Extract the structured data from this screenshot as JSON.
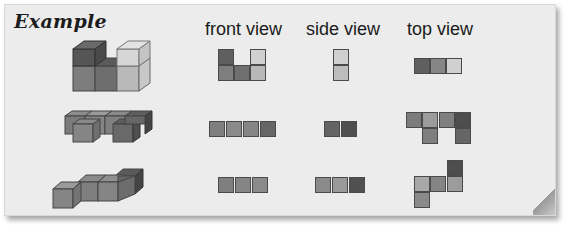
{
  "title": "Example",
  "columns": [
    {
      "label": "front view"
    },
    {
      "label": "side view"
    },
    {
      "label": "top view"
    }
  ],
  "colors": {
    "dark": "#5f5f5f",
    "darker": "#4e4e4e",
    "medium": "#8a8a8a",
    "medium_light": "#9c9c9c",
    "light": "#c4c4c4",
    "lighter": "#d4d4d4",
    "background": "#ececec"
  },
  "rows": [
    {
      "name": "example-1",
      "description": "U-shaped cube arrangement, 5 cubes",
      "front_view": [
        [
          1,
          0,
          1
        ],
        [
          1,
          1,
          1
        ]
      ],
      "side_view": [
        [
          1
        ],
        [
          1
        ]
      ],
      "top_view": [
        [
          1,
          1,
          1
        ]
      ]
    },
    {
      "name": "example-2",
      "description": "Flat arrangement of 6 cubes in two rows",
      "front_view": [
        [
          1,
          1,
          1,
          1
        ]
      ],
      "side_view": [
        [
          1,
          1
        ]
      ],
      "top_view": [
        [
          1,
          1,
          1,
          1
        ],
        [
          0,
          1,
          0,
          1
        ]
      ]
    },
    {
      "name": "example-3",
      "description": "Flat L/Z-shaped arrangement of 5 cubes",
      "front_view": [
        [
          1,
          1,
          1
        ]
      ],
      "side_view": [
        [
          1,
          1,
          1
        ]
      ],
      "top_view": [
        [
          0,
          0,
          1
        ],
        [
          1,
          1,
          1
        ],
        [
          1,
          0,
          0
        ]
      ]
    }
  ]
}
